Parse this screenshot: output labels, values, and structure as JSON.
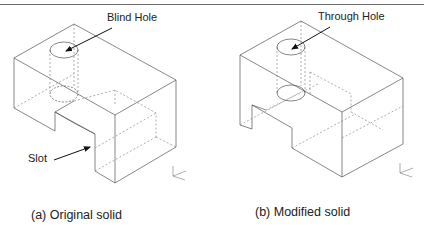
{
  "figure": {
    "panels": [
      {
        "id": "a",
        "caption": "(a) Original solid",
        "annotations": [
          {
            "label": "Blind Hole",
            "target": "hole"
          },
          {
            "label": "Slot",
            "target": "slot"
          }
        ]
      },
      {
        "id": "b",
        "caption": "(b) Modified solid",
        "annotations": [
          {
            "label": "Through Hole",
            "target": "hole"
          }
        ]
      }
    ],
    "colors": {
      "line": "#555555",
      "hidden": "#777777",
      "arrow": "#111111",
      "text": "#222222"
    }
  }
}
